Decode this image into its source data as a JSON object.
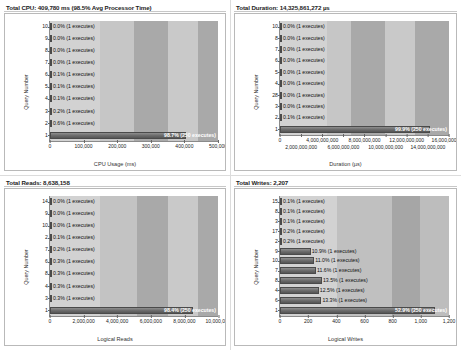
{
  "panels": [
    {
      "id": "cpu",
      "title": "Total CPU: 409,780 ms (98.5% Avg Processor Time)",
      "ylabel": "Query Number",
      "xlabel": "CPU Usage (ms)"
    },
    {
      "id": "duration",
      "title": "Total Duration: 14,325,861,272 µs",
      "ylabel": "Query Number",
      "xlabel": "Duration (µs)"
    },
    {
      "id": "reads",
      "title": "Total Reads: 8,638,158",
      "ylabel": "Query Number",
      "xlabel": "Logical Reads"
    },
    {
      "id": "writes",
      "title": "Total Writes: 2,207",
      "ylabel": "Query Number",
      "xlabel": "Logical Writes"
    }
  ],
  "chart_data": [
    {
      "type": "bar",
      "orientation": "horizontal",
      "title": "Total CPU: 409,780 ms (98.5% Avg Processor Time)",
      "xlabel": "CPU Usage (ms)",
      "ylabel": "Query Number",
      "xlim": [
        0,
        500000
      ],
      "grid": false,
      "xticks": [
        0,
        100000,
        200000,
        300000,
        400000,
        500000
      ],
      "xticklabels": [
        "0",
        "100,000",
        "200,000",
        "300,000",
        "400,000",
        "500,000"
      ],
      "categories": [
        "10",
        "9",
        "8",
        "7",
        "6",
        "5",
        "4",
        "3",
        "2",
        "1"
      ],
      "values": [
        150,
        160,
        170,
        200,
        300,
        350,
        420,
        900,
        2200,
        404000
      ],
      "labels": [
        "0.0% (1 executes)",
        "0.0% (1 executes)",
        "0.0% (1 executes)",
        "0.0% (1 executes)",
        "0.1% (1 executes)",
        "0.1% (1 executes)",
        "0.1% (1 executes)",
        "0.2% (1 executes)",
        "0.6% (1 executes)",
        "98.7% (250 executes)"
      ]
    },
    {
      "type": "bar",
      "orientation": "horizontal",
      "title": "Total Duration: 14,325,861,272 µs",
      "xlabel": "Duration (µs)",
      "ylabel": "Query Number",
      "xlim": [
        0,
        16000000000
      ],
      "grid": false,
      "xticks": [
        0,
        2000000000,
        4000000000,
        6000000000,
        8000000000,
        10000000000,
        12000000000,
        14000000000,
        16000000000
      ],
      "xticklabels": [
        "0",
        "2,000,000,000",
        "4,000,000,000",
        "6,000,000,000",
        "8,000,000,000",
        "10,000,000,000",
        "12,000,000,000",
        "14,000,000,000",
        "16,000,000,000"
      ],
      "categories": [
        "10",
        "8",
        "7",
        "6",
        "5",
        "4",
        "28",
        "3",
        "2",
        "1"
      ],
      "values": [
        1000000,
        1500000,
        2000000,
        2500000,
        3000000,
        3200000,
        3500000,
        4000000,
        14000000,
        14200000000
      ],
      "labels": [
        "0.0% (1 executes)",
        "0.0% (1 executes)",
        "0.0% (1 executes)",
        "0.0% (1 executes)",
        "0.0% (1 executes)",
        "0.0% (1 executes)",
        "0.0% (1 executes)",
        "0.0% (1 executes)",
        "0.1% (1 executes)",
        "99.9% (250 executes)"
      ]
    },
    {
      "type": "bar",
      "orientation": "horizontal",
      "title": "Total Reads: 8,638,158",
      "xlabel": "Logical Reads",
      "ylabel": "Query Number",
      "xlim": [
        0,
        10000000
      ],
      "grid": false,
      "xticks": [
        0,
        2000000,
        4000000,
        6000000,
        8000000,
        10000000
      ],
      "xticklabels": [
        "0",
        "2,000,000",
        "4,000,000",
        "6,000,000",
        "8,000,000",
        "10,000,000"
      ],
      "categories": [
        "14",
        "9",
        "10",
        "2",
        "7",
        "6",
        "8",
        "4",
        "3",
        "1"
      ],
      "values": [
        1500,
        1800,
        2000,
        8600,
        17000,
        25000,
        26000,
        26000,
        26000,
        8500000
      ],
      "labels": [
        "0.0% (1 executes)",
        "0.0% (1 executes)",
        "0.0% (1 executes)",
        "0.1% (1 executes)",
        "0.2% (1 executes)",
        "0.3% (1 executes)",
        "0.3% (1 executes)",
        "0.3% (1 executes)",
        "0.3% (1 executes)",
        "98.4% (250 executes)"
      ]
    },
    {
      "type": "bar",
      "orientation": "horizontal",
      "title": "Total Writes: 2,207",
      "xlabel": "Logical Writes",
      "ylabel": "Query Number",
      "xlim": [
        0,
        1200
      ],
      "grid": false,
      "xticks": [
        0,
        200,
        400,
        600,
        800,
        1000,
        1200
      ],
      "xticklabels": [
        "0",
        "200",
        "400",
        "600",
        "800",
        "1,000",
        "1,200"
      ],
      "categories": [
        "15",
        "8",
        "3",
        "17",
        "2",
        "9",
        "10",
        "7",
        "8",
        "4",
        "6",
        "1"
      ],
      "values": [
        2,
        2,
        3,
        4,
        5,
        218,
        243,
        256,
        298,
        276,
        294,
        1100
      ],
      "labels": [
        "0.1% (1 executes)",
        "0.1% (1 executes)",
        "0.1% (1 executes)",
        "0.2% (1 executes)",
        "0.2% (1 executes)",
        "10.9% (1 executes)",
        "11.0% (1 executes)",
        "11.6% (1 executes)",
        "13.5% (1 executes)",
        "12.5% (1 executes)",
        "13.3% (1 executes)",
        "52.9% (250 executes)"
      ]
    }
  ],
  "colors": {
    "band_light": "#d0d0d0",
    "band_mid": "#bdbdbd",
    "band_dark": "#a8a8a8",
    "bar": "#6f6f6f",
    "axis": "#8a8a8a"
  }
}
